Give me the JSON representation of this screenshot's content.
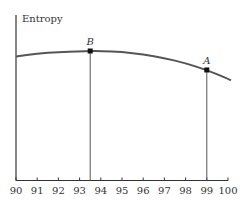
{
  "chart_data": {
    "type": "line",
    "title": "",
    "xlabel": "",
    "ylabel": "Entropy",
    "xlim": [
      90,
      100
    ],
    "x_ticks": [
      90,
      91,
      92,
      93,
      94,
      95,
      96,
      97,
      98,
      99,
      100
    ],
    "grid": false,
    "legend": null,
    "series": [
      {
        "name": "Entropy curve",
        "x": [
          90,
          91,
          92,
          93,
          93.5,
          94,
          95,
          96,
          97,
          98,
          99,
          100
        ],
        "y": [
          0.83,
          0.85,
          0.86,
          0.865,
          0.867,
          0.866,
          0.86,
          0.845,
          0.82,
          0.785,
          0.74,
          0.68
        ],
        "color": "#555555"
      }
    ],
    "annotations": [
      {
        "label": "B",
        "x": 93.5,
        "y": 0.867,
        "note": "maximum entropy point, vertical drop line to x-axis"
      },
      {
        "label": "A",
        "x": 99,
        "y": 0.74,
        "note": "point with vertical drop line to x-axis"
      }
    ]
  },
  "labels": {
    "ylabel": "Entropy",
    "point_b": "B",
    "point_a": "A"
  }
}
